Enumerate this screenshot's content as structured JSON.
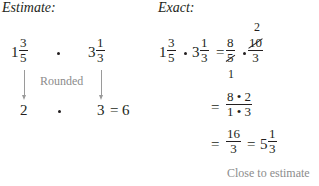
{
  "estimate": {
    "heading": "Estimate:",
    "first": {
      "whole": "1",
      "num": "3",
      "den": "5"
    },
    "second": {
      "whole": "3",
      "num": "1",
      "den": "3"
    },
    "label": "Rounded",
    "rounded_first": "2",
    "rounded_second": "3",
    "equals": "=",
    "result": "6"
  },
  "exact": {
    "heading": "Exact:",
    "line1": {
      "a": {
        "whole": "1",
        "num": "3",
        "den": "5"
      },
      "b": {
        "whole": "3",
        "num": "1",
        "den": "3"
      },
      "equals": "=",
      "f1": {
        "num": "8",
        "den": "5",
        "cancel_den": "1"
      },
      "f2": {
        "num": "10",
        "den": "3",
        "cancel_num": "2"
      }
    },
    "line2": {
      "equals": "=",
      "num": "8 • 2",
      "den": "1 • 3"
    },
    "line3": {
      "equals": "=",
      "num": "16",
      "den": "3",
      "equals2": "=",
      "whole": "5",
      "mnum": "1",
      "mden": "3"
    },
    "note": "Close to estimate"
  }
}
